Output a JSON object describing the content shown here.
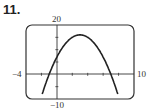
{
  "problem_number": "11.",
  "chart_data": {
    "type": "line",
    "title": "",
    "xlabel": "",
    "ylabel": "",
    "xlim": [
      -4,
      10
    ],
    "ylim": [
      -10,
      20
    ],
    "grid": false,
    "tick_labels": {
      "xmin": "−4",
      "xmax": "10",
      "ymin": "−10",
      "ymax": "20"
    },
    "series": [
      {
        "name": "parabola",
        "x": [
          -1.9,
          -1,
          0,
          1,
          2,
          3,
          4,
          5,
          6,
          7,
          7.9
        ],
        "y": [
          -10,
          0,
          7,
          12,
          15,
          16,
          15,
          12,
          7,
          0,
          -10
        ]
      }
    ]
  }
}
